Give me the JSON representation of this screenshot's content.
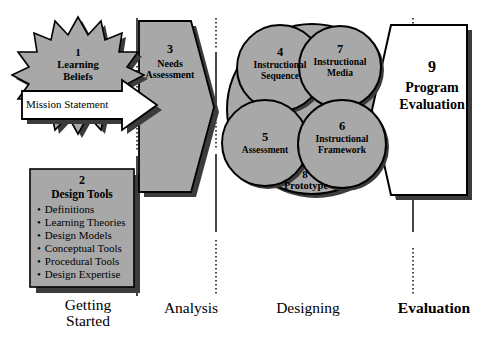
{
  "diagram": {
    "colors": {
      "shape_fill": "#a8a8a8",
      "shape_stroke": "#000000",
      "shadow": "#3c3c3c",
      "white_fill": "#ffffff",
      "background": "#ffffff"
    },
    "elements": {
      "learning_beliefs": {
        "number": "1",
        "label": "Learning\nBeliefs",
        "shape": "starburst"
      },
      "mission_statement": {
        "label": "Mission Statement",
        "shape": "right-arrow"
      },
      "needs_assessment": {
        "number": "3",
        "label": "Needs\nAssessment",
        "shape": "pentagon-arrow"
      },
      "design_tools": {
        "number": "2",
        "title": "Design Tools",
        "shape": "rectangle",
        "items": [
          "Definitions",
          "Learning Theories",
          "Design Models",
          "Conceptual Tools",
          "Procedural Tools",
          "Design Expertise"
        ]
      },
      "instructional_sequence": {
        "number": "4",
        "label": "Instructional\nSequence",
        "shape": "circle"
      },
      "assessment": {
        "number": "5",
        "label": "Assessment",
        "shape": "circle"
      },
      "instructional_framework": {
        "number": "6",
        "label": "Instructional\nFramework",
        "shape": "circle"
      },
      "instructional_media": {
        "number": "7",
        "label": "Instructional\nMedia",
        "shape": "circle"
      },
      "prototype": {
        "number": "8",
        "label": "Prototype",
        "shape": "large-circle"
      },
      "program_evaluation": {
        "number": "9",
        "label": "Program\nEvaluation",
        "shape": "pentagon"
      }
    },
    "phases": [
      {
        "label": "Getting\nStarted",
        "bold": false
      },
      {
        "label": "Analysis",
        "bold": false
      },
      {
        "label": "Designing",
        "bold": false
      },
      {
        "label": "Evaluation",
        "bold": true
      }
    ]
  }
}
